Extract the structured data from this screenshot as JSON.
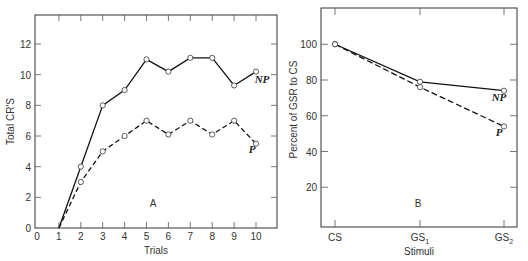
{
  "chart_data": [
    {
      "type": "line",
      "panel_label": "A",
      "xlabel": "Trials",
      "ylabel": "Total CR'S",
      "x": [
        1,
        2,
        3,
        4,
        5,
        6,
        7,
        8,
        9,
        10
      ],
      "xticks": [
        "0",
        "1",
        "2",
        "3",
        "4",
        "5",
        "6",
        "7",
        "8",
        "9",
        "10"
      ],
      "yticks": [
        "0",
        "2",
        "4",
        "6",
        "8",
        "10",
        "12"
      ],
      "xlim": [
        0,
        10.3
      ],
      "ylim": [
        0,
        13
      ],
      "series": [
        {
          "name": "NP",
          "style": "solid",
          "values": [
            0,
            4,
            8,
            9,
            11,
            10.2,
            11.1,
            11.1,
            9.3,
            10.2
          ]
        },
        {
          "name": "P",
          "style": "dashed",
          "values": [
            0,
            3,
            5,
            6,
            7,
            6.1,
            7,
            6.1,
            7,
            5.5
          ]
        }
      ]
    },
    {
      "type": "line",
      "panel_label": "B",
      "xlabel": "Stimuli",
      "ylabel": "Percent of GSR to CS",
      "categories": [
        "CS",
        "GS1",
        "GS2"
      ],
      "yticks": [
        "20",
        "40",
        "60",
        "80",
        "100"
      ],
      "ylim": [
        0,
        120
      ],
      "series": [
        {
          "name": "NP",
          "style": "solid",
          "values": [
            100,
            79,
            74
          ]
        },
        {
          "name": "P",
          "style": "dashed",
          "values": [
            100,
            76,
            54
          ]
        }
      ]
    }
  ],
  "panelA": {
    "label": "A",
    "xlabel": "Trials",
    "ylabel": "Total CR'S",
    "np": "NP",
    "p": "P"
  },
  "panelB": {
    "label": "B",
    "xlabel": "Stimuli",
    "ylabel": "Percent of GSR to CS",
    "np": "NP",
    "p": "P",
    "cats": [
      {
        "main": "CS",
        "sub": ""
      },
      {
        "main": "GS",
        "sub": "1"
      },
      {
        "main": "GS",
        "sub": "2"
      }
    ]
  }
}
